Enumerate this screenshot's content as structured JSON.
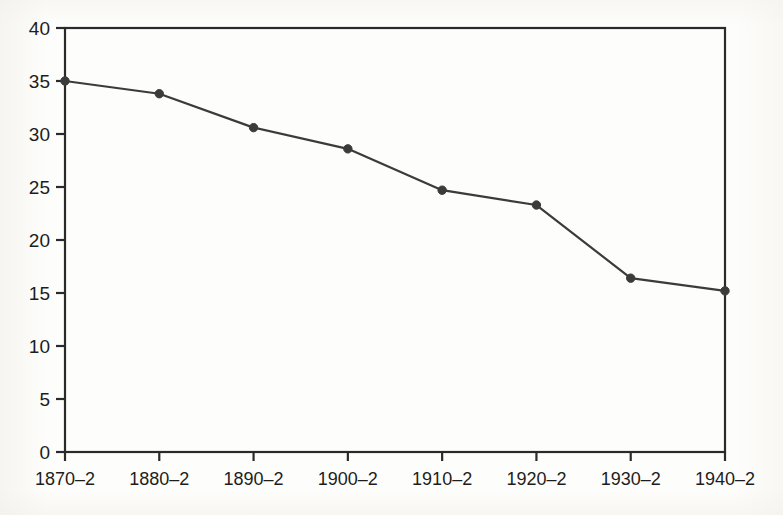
{
  "chart_data": {
    "type": "line",
    "title": "",
    "subtitle": "",
    "xlabel": "",
    "ylabel": "",
    "categories": [
      "1870–2",
      "1880–2",
      "1890–2",
      "1900–2",
      "1910–2",
      "1920–2",
      "1930–2",
      "1940–2"
    ],
    "values": [
      35.0,
      33.8,
      30.6,
      28.6,
      24.7,
      23.3,
      16.4,
      15.2
    ],
    "series": [
      {
        "name": "series-1",
        "values": [
          35.0,
          33.8,
          30.6,
          28.6,
          24.7,
          23.3,
          16.4,
          15.2
        ]
      }
    ],
    "ylim": [
      0,
      40
    ],
    "y_ticks": [
      0,
      5,
      10,
      15,
      20,
      25,
      30,
      35,
      40
    ],
    "y_tick_labels": [
      "0",
      "5",
      "10",
      "15",
      "20",
      "25",
      "30",
      "35",
      "40"
    ],
    "x_tick_labels": [
      "1870–2",
      "1880–2",
      "1890–2",
      "1900–2",
      "1910–2",
      "1920–2",
      "1930–2",
      "1940–2"
    ],
    "grid": false,
    "legend": false,
    "legend_position": "none",
    "marker": "filled-circle",
    "line_color": "#3b3b3b",
    "marker_color": "#3b3b3b",
    "axis_color": "#2a2a2a",
    "background_color": "#fdfdfb",
    "frame": "box"
  },
  "axes": {
    "y_labels": [
      "40",
      "35",
      "30",
      "25",
      "20",
      "15",
      "10",
      "5",
      "0"
    ],
    "x_labels": [
      "1870–2",
      "1880–2",
      "1890–2",
      "1900–2",
      "1910–2",
      "1920–2",
      "1930–2",
      "1940–2"
    ]
  }
}
